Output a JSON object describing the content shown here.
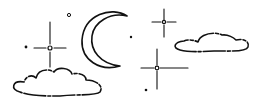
{
  "scene": {
    "title": "Night sky illustration",
    "elements": [
      "crescent-moon",
      "sparkle-star",
      "sparkle-star",
      "sparkle-star",
      "cloud",
      "cloud",
      "dot-star",
      "dot-star",
      "dot-star",
      "dot-star"
    ],
    "colors": {
      "ink": "#111111",
      "background": "#ffffff"
    }
  }
}
